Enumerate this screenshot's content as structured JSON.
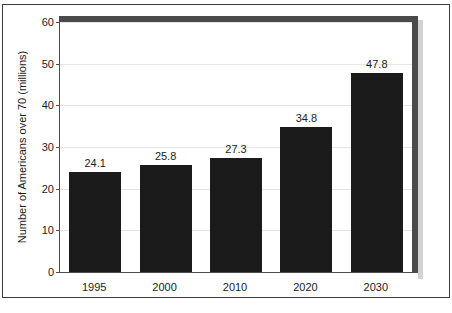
{
  "chart_data": {
    "type": "bar",
    "title": "",
    "xlabel": "",
    "ylabel": "Number of Americans over 70 (millions)",
    "categories": [
      "1995",
      "2000",
      "2010",
      "2020",
      "2030"
    ],
    "values": [
      24.1,
      25.8,
      27.3,
      34.8,
      47.8
    ],
    "value_labels": [
      "24.1",
      "25.8",
      "27.3",
      "34.8",
      "47.8"
    ],
    "ylim": [
      0,
      60
    ],
    "yticks": [
      0,
      10,
      20,
      30,
      40,
      50,
      60
    ],
    "ytick_labels": [
      "0",
      "10",
      "20",
      "30",
      "40",
      "50",
      "60"
    ],
    "grid": true,
    "legend": false,
    "bar_color": "#1b1b1b",
    "grid_color": "#e6e6e6",
    "axis_color": "#4d4d4d",
    "frame_color": "#4a4a4a",
    "shadow_color": "#d2d2d2",
    "background_color": "#ffffff"
  }
}
